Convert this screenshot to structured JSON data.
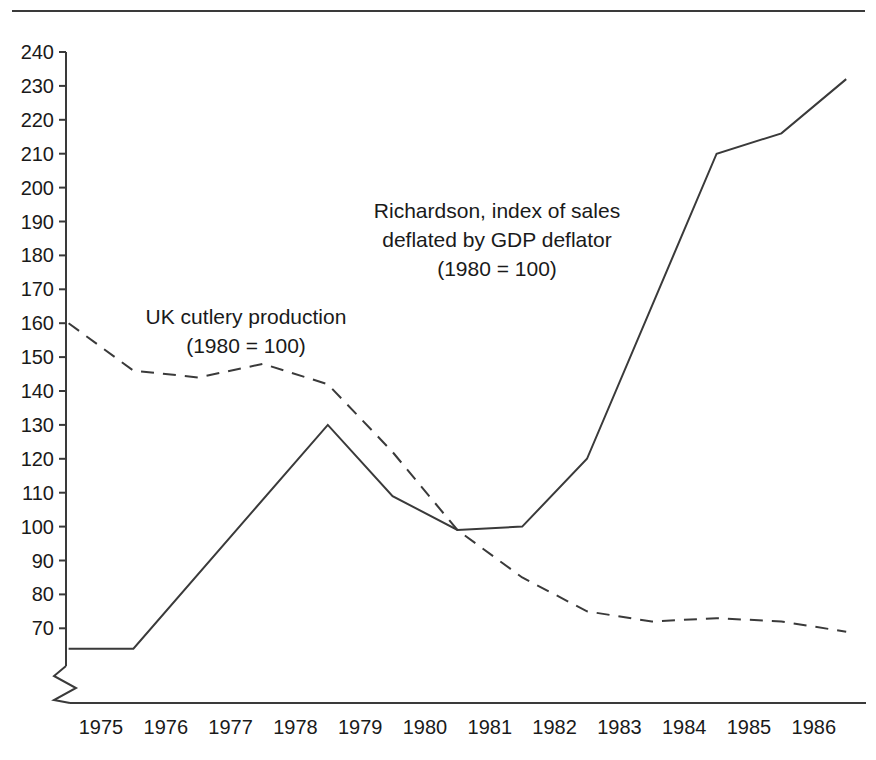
{
  "figure": {
    "background_color": "#ffffff",
    "line_color": "#3a3a3a",
    "text_color": "#1a1a1a",
    "has_top_rule": true,
    "axis_break_symbol": "zigzag"
  },
  "annotations": [
    {
      "name": "uk-cutlery-label",
      "lines": [
        "UK cutlery production",
        "(1980 = 100)"
      ],
      "x": 246,
      "y": 302,
      "series": "UK cutlery production"
    },
    {
      "name": "richardson-label",
      "lines": [
        "Richardson, index of sales",
        "deflated by GDP deflator",
        "(1980 = 100)"
      ],
      "x": 497,
      "y": 196,
      "series": "Richardson, index of sales deflated by GDP deflator"
    }
  ],
  "chart_data": {
    "type": "line",
    "title": "",
    "subtitle": "",
    "xlabel": "",
    "ylabel": "",
    "xlim": [
      1974.5,
      1986.5
    ],
    "ylim": [
      64,
      244
    ],
    "y_axis_break_below": 70,
    "grid": false,
    "legend": "inline-annotations",
    "x_ticks": [
      1975,
      1976,
      1977,
      1978,
      1979,
      1980,
      1981,
      1982,
      1983,
      1984,
      1985,
      1986
    ],
    "x_tick_labels": [
      "1975",
      "1976",
      "1977",
      "1978",
      "1979",
      "1980",
      "1981",
      "1982",
      "1983",
      "1984",
      "1985",
      "1986"
    ],
    "y_ticks": [
      70,
      80,
      90,
      100,
      110,
      120,
      130,
      140,
      150,
      160,
      170,
      180,
      190,
      200,
      210,
      220,
      230,
      240
    ],
    "y_tick_labels": [
      "70",
      "80",
      "90",
      "100",
      "110",
      "120",
      "130",
      "140",
      "150",
      "160",
      "170",
      "180",
      "190",
      "200",
      "210",
      "220",
      "230",
      "240"
    ],
    "series": [
      {
        "name": "Richardson, index of sales deflated by GDP deflator",
        "style": "solid",
        "color": "#3a3a3a",
        "x": [
          1974.5,
          1975.5,
          1978.5,
          1979.5,
          1980.5,
          1981.5,
          1982.5,
          1984.5,
          1985.5,
          1986.5
        ],
        "values": [
          64,
          64,
          130,
          109,
          99,
          100,
          120,
          210,
          216,
          232
        ]
      },
      {
        "name": "UK cutlery production",
        "style": "dashed",
        "color": "#3a3a3a",
        "x": [
          1974.5,
          1975.5,
          1976.5,
          1977.5,
          1978.5,
          1979.5,
          1980.5,
          1981.5,
          1982.5,
          1983.5,
          1984.5,
          1985.5,
          1986.5
        ],
        "values": [
          160,
          146,
          144,
          148,
          142,
          122,
          99,
          85,
          75,
          72,
          73,
          72,
          69
        ]
      }
    ]
  }
}
